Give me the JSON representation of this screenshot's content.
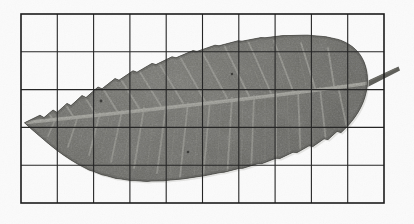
{
  "image": {
    "kind": "natural-image-photograph",
    "subject": "leaf-specimen",
    "caption": "",
    "width_px": 414,
    "height_px": 224,
    "background_color": "#fbfbfb",
    "color_mode": "grayscale"
  },
  "grid_overlay": {
    "name": "measurement-grid",
    "columns": 10,
    "rows": 5,
    "line_color": "#262626",
    "line_width_px": 1.1,
    "border_color": "#1c1c1c",
    "border_width_px": 1.6,
    "left_px": 21,
    "top_px": 14,
    "right_px": 384,
    "bottom_px": 203,
    "cell_width_px": 36.3,
    "cell_height_px": 37.8,
    "x_lines": [
      21,
      57.3,
      93.6,
      129.9,
      166.2,
      202.5,
      238.8,
      275.1,
      311.4,
      347.7,
      384
    ],
    "y_lines": [
      14,
      51.8,
      89.6,
      127.4,
      165.2,
      203
    ]
  },
  "leaf": {
    "name": "leaf-blade",
    "outline_type": "elliptic-lanceolate",
    "margin": "serrate",
    "apex_position": {
      "x": 24,
      "y": 123
    },
    "base_position": {
      "x": 368,
      "y": 95
    },
    "widest_point": {
      "x": 236,
      "y": 107
    },
    "max_height_px": 176,
    "length_px": 344,
    "blade_color_dark": "#53534f",
    "blade_color_mid": "#6c6c67",
    "blade_color_light": "#7e7e78",
    "vein_color": "#a9a9a2",
    "edge_shadow_color": "#3a3a37"
  },
  "midrib": {
    "name": "midrib-primary-vein",
    "color": "#b2b2aa",
    "start": {
      "x": 26,
      "y": 122
    },
    "end": {
      "x": 366,
      "y": 83
    },
    "width_px": 3.2
  },
  "petiole": {
    "name": "petiole-stem",
    "color": "#5d5d59",
    "start": {
      "x": 360,
      "y": 84
    },
    "end": {
      "x": 399,
      "y": 67
    },
    "width_px": 6
  },
  "lateral_veins": {
    "name": "lateral-vein-set",
    "count_upper": 13,
    "count_lower": 13,
    "color": "#a6a69f",
    "width_px": 1.7,
    "branch_angle_upper_deg": -44,
    "branch_angle_lower_deg": 46
  },
  "blemishes": [
    {
      "x": 152,
      "y": 46,
      "r": 1.6
    },
    {
      "x": 101,
      "y": 101,
      "r": 1.4
    },
    {
      "x": 232,
      "y": 74,
      "r": 1.2
    },
    {
      "x": 188,
      "y": 152,
      "r": 1.3
    }
  ]
}
